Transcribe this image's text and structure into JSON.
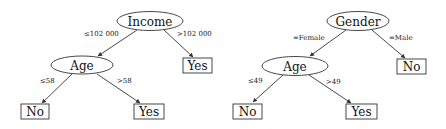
{
  "trees": [
    {
      "root": {
        "label": "Income"
      },
      "edges": {
        "left": "≤102 000",
        "right": ">102 000",
        "left_left": "≤58",
        "left_right": ">58"
      },
      "internal": {
        "label": "Age"
      },
      "leaves": {
        "right": "Yes",
        "left_left": "No",
        "left_right": "Yes"
      }
    },
    {
      "root": {
        "label": "Gender"
      },
      "edges": {
        "left": "=Female",
        "right": "=Male",
        "left_left": "≤49",
        "left_right": ">49"
      },
      "internal": {
        "label": "Age"
      },
      "leaves": {
        "right": "No",
        "left_left": "No",
        "left_right": "Yes"
      }
    }
  ]
}
